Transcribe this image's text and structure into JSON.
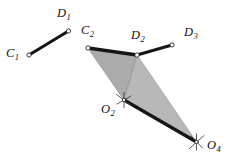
{
  "figure": {
    "background_color": "#ffffff",
    "width": 229,
    "height": 163,
    "link_color": "#111111",
    "body_fill_color": "#a8a8a8",
    "body_stroke_color": "#8e8e8e",
    "joint_fill_color": "#ffffff",
    "joint_stroke_color": "#333333"
  },
  "labels": {
    "c1": "C",
    "c1_sub": "1",
    "d1": "D",
    "d1_sub": "1",
    "c2": "C",
    "c2_sub": "2",
    "d2": "D",
    "d2_sub": "2",
    "d3": "D",
    "d3_sub": "3",
    "o2": "O",
    "o2_sub": "2",
    "o4": "O",
    "o4_sub": "4"
  },
  "points": {
    "C1": {
      "x": 29,
      "y": 55,
      "label": "C1"
    },
    "D1": {
      "x": 68.5,
      "y": 31,
      "label": "D1"
    },
    "C2": {
      "x": 88,
      "y": 48,
      "label": "C2"
    },
    "D2": {
      "x": 137,
      "y": 55,
      "label": "D2"
    },
    "D3": {
      "x": 172,
      "y": 45,
      "label": "D3"
    },
    "O2": {
      "x": 124,
      "y": 100,
      "label": "O2"
    },
    "O4": {
      "x": 196.5,
      "y": 142,
      "label": "O4"
    }
  },
  "links": [
    {
      "name": "link-c1-d1",
      "from": "C1",
      "to": "D1"
    },
    {
      "name": "link-c2-d2",
      "from": "C2",
      "to": "D2"
    },
    {
      "name": "link-d2-d3",
      "from": "D2",
      "to": "D3"
    },
    {
      "name": "link-o2-o4",
      "from": "O2",
      "to": "O4"
    }
  ],
  "bodies": [
    {
      "name": "triangle-c2-d2-o2",
      "vertices": [
        "C2",
        "D2",
        "O2"
      ]
    },
    {
      "name": "triangle-d2-o2-o4",
      "vertices": [
        "D2",
        "O2",
        "O4"
      ]
    }
  ],
  "ground_pivots": [
    "O2",
    "O4"
  ],
  "pin_joints": [
    "C1",
    "D1",
    "C2",
    "D2",
    "D3"
  ]
}
